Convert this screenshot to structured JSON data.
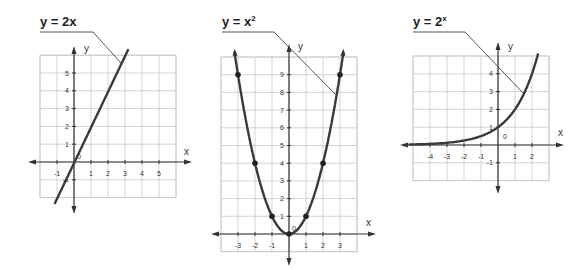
{
  "chart_data": [
    {
      "type": "line",
      "title": "y = 2x",
      "function": "linear",
      "xlabel": "x",
      "ylabel": "y",
      "origin_label": "0",
      "x_ticks": [
        "-1",
        "1",
        "2",
        "3",
        "4",
        "5"
      ],
      "y_ticks": [
        "-1",
        "1",
        "2",
        "3",
        "4",
        "5"
      ],
      "xlim": [
        -2,
        6
      ],
      "ylim": [
        -2,
        6
      ],
      "grid": true,
      "series": [
        {
          "name": "y = 2x",
          "x": [
            -1.1,
            0,
            1,
            2,
            2.85
          ],
          "y": [
            -2.2,
            0,
            2,
            4,
            5.7
          ]
        }
      ]
    },
    {
      "type": "line",
      "title": "y = x²",
      "function": "quadratic",
      "xlabel": "x",
      "ylabel": "y",
      "origin_label": "0",
      "x_ticks": [
        "-3",
        "-2",
        "-1",
        "1",
        "2",
        "3"
      ],
      "y_ticks": [
        "1",
        "2",
        "3",
        "4",
        "5",
        "6",
        "7",
        "8",
        "9"
      ],
      "xlim": [
        -4,
        4
      ],
      "ylim": [
        -1,
        10
      ],
      "grid": true,
      "series": [
        {
          "name": "y = x²",
          "x": [
            -3,
            -2,
            -1,
            0,
            1,
            2,
            3
          ],
          "y": [
            9,
            4,
            1,
            0,
            1,
            4,
            9
          ],
          "markers": true
        }
      ]
    },
    {
      "type": "line",
      "title": "y = 2ˣ",
      "function": "exponential",
      "xlabel": "x",
      "ylabel": "y",
      "origin_label": "0",
      "x_ticks": [
        "-4",
        "-3",
        "-2",
        "-1",
        "1",
        "2"
      ],
      "y_ticks": [
        "-1",
        "1",
        "2",
        "3",
        "4"
      ],
      "xlim": [
        -5,
        3
      ],
      "ylim": [
        -2,
        5
      ],
      "grid": true,
      "series": [
        {
          "name": "y = 2ˣ",
          "x": [
            -5,
            -4,
            -3,
            -2,
            -1,
            0,
            1,
            1.5,
            2,
            2.3
          ],
          "y": [
            0.03,
            0.06,
            0.125,
            0.25,
            0.5,
            1,
            2,
            2.83,
            4,
            4.9
          ]
        }
      ]
    }
  ],
  "graphs": [
    {
      "title": "y = 2x",
      "title_main": "y = 2x",
      "title_sup": "",
      "xlabel": "x",
      "ylabel": "y",
      "origin": "0"
    },
    {
      "title_main": "y = x",
      "title_sup": "2",
      "xlabel": "x",
      "ylabel": "y",
      "origin": "0"
    },
    {
      "title_main": "y = 2",
      "title_sup": "x",
      "xlabel": "x",
      "ylabel": "y",
      "origin": "0"
    }
  ]
}
